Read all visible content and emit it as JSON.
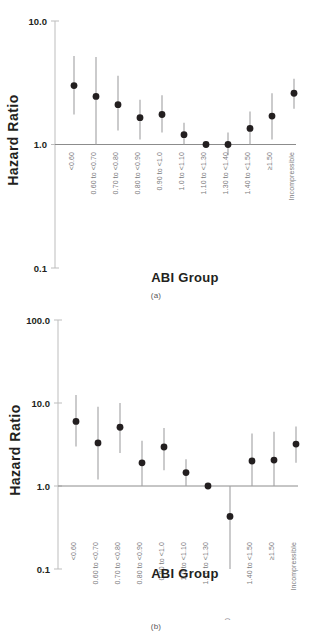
{
  "figure": {
    "ylabel": "Hazard Ratio",
    "xlabel": "ABI Group"
  },
  "panel_a": {
    "caption": "(a)",
    "yticks": [
      "10.0",
      "1.0",
      "0.1"
    ]
  },
  "panel_b": {
    "caption": "(b)",
    "yticks": [
      "100.0",
      "10.0",
      "1.0",
      "0.1"
    ]
  },
  "chart_data": [
    {
      "type": "scatter",
      "id": "panel-a",
      "title": "(a)",
      "xlabel": "ABI Group",
      "ylabel": "Hazard Ratio",
      "yscale": "log",
      "ylim": [
        0.1,
        10.0
      ],
      "ytick_values": [
        10.0,
        1.0,
        0.1
      ],
      "ytick_labels": [
        "10.0",
        "1.0",
        "0.1"
      ],
      "grid": false,
      "reference_line": 1.0,
      "legend": "none",
      "categories": [
        "<0.60",
        "0.60 to <0.70",
        "0.70 to <0.80",
        "0.80 to <0.90",
        "0.90 to <1.0",
        "1.0 to <1.10",
        "1.10 to <1.30",
        "1.30 to <1.40",
        "1.40 to <1.50",
        "≥1.50",
        "Incompressible"
      ],
      "values": [
        3.0,
        2.45,
        2.1,
        1.65,
        1.75,
        1.2,
        1.0,
        1.0,
        1.35,
        1.7,
        2.6
      ],
      "ci_low": [
        1.75,
        1.0,
        1.3,
        1.1,
        1.25,
        1.0,
        1.0,
        0.82,
        1.0,
        1.1,
        1.95
      ],
      "ci_high": [
        5.2,
        5.1,
        3.6,
        2.3,
        2.5,
        1.5,
        1.0,
        1.25,
        1.85,
        2.6,
        3.4
      ]
    },
    {
      "type": "scatter",
      "id": "panel-b",
      "title": "(b)",
      "xlabel": "ABI Group",
      "ylabel": "Hazard Ratio",
      "yscale": "log",
      "ylim": [
        0.1,
        100.0
      ],
      "ytick_values": [
        100.0,
        10.0,
        1.0,
        0.1
      ],
      "ytick_labels": [
        "100.0",
        "10.0",
        "1.0",
        "0.1"
      ],
      "grid": false,
      "reference_line": 1.0,
      "legend": "none",
      "categories": [
        "<0.60",
        "0.60 to <0.70",
        "0.70 to <0.80",
        "0.80 to <0.90",
        "0.90 to <1.0",
        "1.0 to <1.10",
        "1.10 to <1.30",
        "1.30 to <1.40",
        "1.40 to <1.50",
        "≥1.50",
        "Incompressible"
      ],
      "values": [
        6.0,
        3.3,
        5.1,
        1.9,
        2.95,
        1.45,
        1.0,
        0.43,
        2.0,
        2.05,
        3.2
      ],
      "ci_low": [
        3.0,
        1.2,
        2.5,
        1.0,
        1.55,
        1.0,
        1.0,
        0.1,
        1.0,
        1.0,
        1.9
      ],
      "ci_high": [
        12.5,
        9.0,
        10.0,
        3.5,
        5.0,
        2.1,
        1.0,
        1.0,
        4.3,
        4.5,
        5.2
      ]
    }
  ]
}
